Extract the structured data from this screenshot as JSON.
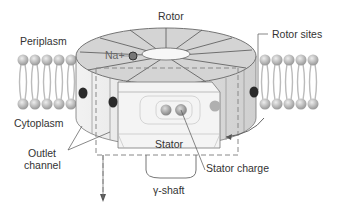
{
  "diagram": {
    "labels": {
      "rotor": "Rotor",
      "periplasm": "Periplasm",
      "rotor_sites": "Rotor sites",
      "ion": "Na+",
      "cytoplasm": "Cytoplasm",
      "outlet_channel_line1": "Outlet",
      "outlet_channel_line2": "channel",
      "stator": "Stator",
      "stator_charge": "Stator charge",
      "gamma_shaft": "γ-shaft"
    },
    "colors": {
      "rotor_top": "#d4d4d4",
      "rotor_side": "#e6e6e6",
      "stator": "#f0f0f0",
      "lipid_head": "#bdbdbd",
      "site_dark": "#2a2a2a",
      "outline": "#555555",
      "text": "#333333"
    }
  }
}
